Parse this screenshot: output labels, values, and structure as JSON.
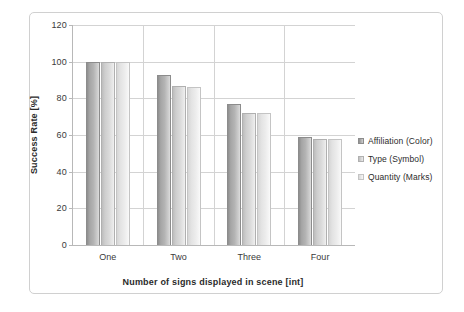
{
  "chart_data": {
    "type": "bar",
    "title": "",
    "xlabel": "Number of signs displayed in scene [int]",
    "ylabel": "Success Rate [%]",
    "categories": [
      "One",
      "Two",
      "Three",
      "Four"
    ],
    "series": [
      {
        "name": "Affiliation (Color)",
        "values": [
          100,
          93,
          77,
          59
        ]
      },
      {
        "name": "Type (Symbol)",
        "values": [
          100,
          87,
          72,
          58
        ]
      },
      {
        "name": "Quantity (Marks)",
        "values": [
          100,
          86,
          72,
          58
        ]
      }
    ],
    "ylim": [
      0,
      120
    ],
    "yticks": [
      0,
      20,
      40,
      60,
      80,
      100,
      120
    ],
    "ytick_labels": [
      "0",
      "20",
      "40",
      "60",
      "80",
      "100",
      "120"
    ],
    "grid": true,
    "legend_position": "right",
    "colors": {
      "series_0": "#a5a5a5",
      "series_1": "#cecece",
      "series_2": "#e3e3e3",
      "gridline": "#d3d3d3",
      "axis": "#b8b8b8",
      "text": "#2b2b2b",
      "frame_border": "#d0d0d0",
      "background": "#ffffff"
    }
  }
}
